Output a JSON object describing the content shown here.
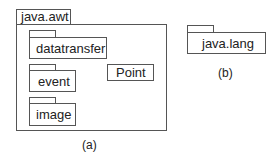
{
  "diagram": {
    "type": "uml-package-diagram",
    "figure_a": {
      "caption": "(a)",
      "package": {
        "name": "java.awt",
        "subpackages": [
          {
            "name": "datatransfer"
          },
          {
            "name": "event"
          },
          {
            "name": "image"
          }
        ],
        "classes": [
          {
            "name": "Point"
          }
        ]
      }
    },
    "figure_b": {
      "caption": "(b)",
      "package": {
        "name": "java.lang"
      }
    }
  }
}
